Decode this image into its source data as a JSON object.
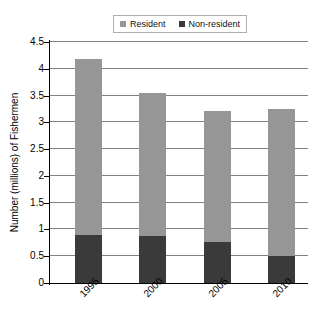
{
  "chart_data": {
    "type": "bar",
    "subtype": "stacked-vertical",
    "title": "",
    "xlabel": "",
    "ylabel": "Number (millions) of Fishermen",
    "categories": [
      "1995",
      "2000",
      "2005",
      "2010"
    ],
    "ylim": [
      0,
      4.5
    ],
    "yticks": [
      "0",
      "0.5",
      "1",
      "1.5",
      "2",
      "2.5",
      "3",
      "3.5",
      "4",
      "4.5"
    ],
    "ytick_values": [
      0,
      0.5,
      1,
      1.5,
      2,
      2.5,
      3,
      3.5,
      4,
      4.5
    ],
    "grid": "horizontal",
    "legend_position": "top-center",
    "series": [
      {
        "name": "Non-resident",
        "color": "#3a3a3a",
        "values": [
          0.89,
          0.87,
          0.76,
          0.5
        ]
      },
      {
        "name": "Resident",
        "color": "#969696",
        "values": [
          3.3,
          2.68,
          2.46,
          2.75
        ]
      }
    ],
    "totals": [
      4.19,
      3.55,
      3.22,
      3.25
    ],
    "stack_order_bottom_to_top": [
      "Non-resident",
      "Resident"
    ]
  },
  "legend": {
    "items": [
      {
        "label": "Resident",
        "color": "#969696"
      },
      {
        "label": "Non-resident",
        "color": "#3a3a3a"
      }
    ]
  },
  "axes": {
    "y_title": "Number (millions) of Fishermen",
    "y_ticks": [
      "4.5",
      "4",
      "3.5",
      "3",
      "2.5",
      "2",
      "1.5",
      "1",
      "0.5",
      "0"
    ],
    "x_ticks": [
      "1995",
      "2000",
      "2005",
      "2010"
    ]
  },
  "colors": {
    "resident": "#969696",
    "non_resident": "#3a3a3a",
    "gridline": "#808080",
    "axis": "#000000",
    "background": "#ffffff"
  }
}
